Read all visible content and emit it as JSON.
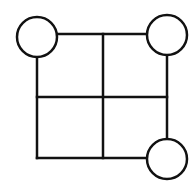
{
  "diagram": {
    "type": "grid-with-corner-circles",
    "stroke_color": "#111111",
    "fill_color": "#ffffff",
    "stroke_width": 2.5,
    "grid": {
      "x_lines": [
        37,
        103,
        167
      ],
      "y_lines": [
        34,
        97,
        158
      ],
      "rows": 2,
      "cols": 2
    },
    "circles": [
      {
        "id": "top-left",
        "cx": 37,
        "cy": 37,
        "r": 20
      },
      {
        "id": "top-right",
        "cx": 167,
        "cy": 35,
        "r": 20
      },
      {
        "id": "bottom-right",
        "cx": 167,
        "cy": 159,
        "r": 20
      }
    ]
  }
}
